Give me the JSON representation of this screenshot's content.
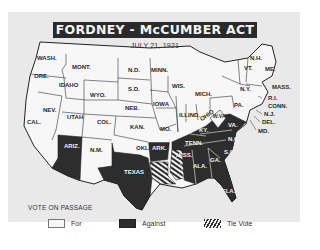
{
  "map": {
    "title": "FORDNEY - McCUMBER ACT",
    "date": "JULY 21, 1921",
    "colors": {
      "for": "#f6f6f6",
      "against": "#2d2d2d",
      "tie": "hatched",
      "background": "#e9e9e9"
    },
    "states": {
      "for": [
        "WASH.",
        "ORE.",
        "CAL.",
        "IDAHO",
        "NEV.",
        "MONT.",
        "WYO.",
        "UTAH",
        "COL.",
        "N.M.",
        "N.D.",
        "S.D.",
        "NEB.",
        "KAN.",
        "OKLA.",
        "MINN.",
        "IOWA",
        "MO.",
        "WIS.",
        "ILL.",
        "MICH.",
        "IND.",
        "OHIO",
        "W.VA.",
        "PA.",
        "N.Y.",
        "VT.",
        "N.H.",
        "ME.",
        "MASS.",
        "R.I.",
        "CONN.",
        "N.J.",
        "DEL.",
        "MD."
      ],
      "against": [
        "ARIZ.",
        "TEXAS",
        "ARK.",
        "KY.",
        "VA.",
        "N.C.",
        "TENN.",
        "ALA.",
        "GA.",
        "S.C.",
        "FLA."
      ],
      "tie": [
        "LA.",
        "MISS."
      ]
    },
    "labels": {
      "wash": "WASH.",
      "ore": "ORE.",
      "cal": "CAL.",
      "idaho": "IDAHO",
      "nev": "NEV.",
      "mont": "MONT.",
      "wyo": "WYO.",
      "utah": "UTAH",
      "col": "COL.",
      "ariz": "ARIZ.",
      "nm": "N.M.",
      "nd": "N.D.",
      "sd": "S.D.",
      "neb": "NEB.",
      "kan": "KAN.",
      "okla": "OKLA.",
      "texas": "TEXAS",
      "minn": "MINN.",
      "iowa": "IOWA",
      "mo": "MO.",
      "ark": "ARK.",
      "wis": "WIS.",
      "ill": "ILL.",
      "mich": "MICH.",
      "ind": "IND.",
      "ohio": "OHIO",
      "ky": "KY.",
      "tenn": "TENN.",
      "miss": "MISS.",
      "ala": "ALA.",
      "ga": "GA.",
      "fla": "FLA.",
      "sc": "S.C.",
      "nc": "N.C.",
      "va": "VA.",
      "wva": "W.VA.",
      "pa": "PA.",
      "ny": "N.Y.",
      "vt": "VT.",
      "nh": "N.H.",
      "me": "ME.",
      "mass": "MASS.",
      "ri": "R.I.",
      "conn": "CONN.",
      "nj": "N.J.",
      "del": "DEL.",
      "md": "MD."
    }
  },
  "legend": {
    "title": "VOTE ON PASSAGE",
    "items": [
      {
        "label": "For",
        "swatch": "for"
      },
      {
        "label": "Against",
        "swatch": "against"
      },
      {
        "label": "Tie Vote",
        "swatch": "tie"
      }
    ]
  }
}
